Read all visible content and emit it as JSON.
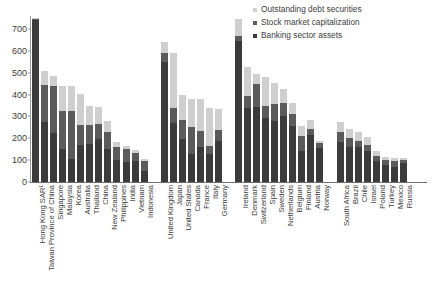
{
  "legend": {
    "position": "top-right",
    "items": [
      {
        "label": "Outstanding debt securities",
        "color": "#cfcfcf",
        "key": "debt"
      },
      {
        "label": "Stock market capitalization",
        "color": "#5b5b5b",
        "key": "stock"
      },
      {
        "label": "Banking sector assets",
        "color": "#3b3b3b",
        "key": "bank"
      }
    ]
  },
  "axis": {
    "y_ticks": [
      0,
      100,
      200,
      300,
      400,
      500,
      600,
      700
    ],
    "y_min": 0,
    "y_max": 760,
    "x_label": "",
    "y_label": ""
  },
  "caption": "",
  "chart_data": {
    "type": "bar",
    "title": "",
    "subtitle": "",
    "xlabel": "",
    "ylabel": "",
    "ylim": [
      0,
      760
    ],
    "grid": false,
    "stacked": true,
    "legend_position": "top-right",
    "series": [
      {
        "name": "Banking sector assets",
        "color": "#3b3b3b"
      },
      {
        "name": "Stock market capitalization",
        "color": "#5b5b5b"
      },
      {
        "name": "Outstanding debt securities",
        "color": "#cfcfcf"
      }
    ],
    "groups": [
      {
        "name": "Asia",
        "categories": [
          "Hong Kong SAR¹",
          "Taiwan Province of China",
          "Singapore",
          "Malaysia",
          "Korea",
          "Australia",
          "Thailand",
          "China",
          "New Zealand",
          "Philippines",
          "India",
          "Vietnam",
          "Indonesia"
        ],
        "bank": [
          740,
          275,
          225,
          150,
          105,
          170,
          175,
          195,
          150,
          100,
          90,
          95,
          50
        ],
        "stock": [
          8,
          170,
          215,
          175,
          220,
          90,
          85,
          70,
          80,
          60,
          60,
          40,
          45
        ],
        "debt": [
          2,
          65,
          45,
          115,
          115,
          145,
          90,
          80,
          50,
          25,
          15,
          10,
          10
        ],
        "total": [
          750,
          510,
          485,
          440,
          440,
          405,
          350,
          345,
          280,
          185,
          165,
          145,
          105
        ]
      },
      {
        "name": "Advanced large",
        "categories": [
          "United Kingdom",
          "Japan",
          "United States",
          "Canada",
          "France",
          "Italy",
          "Germany"
        ],
        "bank": [
          550,
          270,
          195,
          130,
          160,
          130,
          190
        ],
        "stock": [
          40,
          70,
          90,
          120,
          75,
          35,
          50
        ],
        "debt": [
          50,
          250,
          115,
          130,
          145,
          175,
          95
        ],
        "total": [
          640,
          590,
          400,
          380,
          380,
          340,
          335
        ]
      },
      {
        "name": "Advanced small",
        "categories": [
          "Ireland",
          "Denmark",
          "Switzerland",
          "Spain",
          "Sweden",
          "Netherlands",
          "Belgium",
          "Finland",
          "Austria",
          "Norway"
        ],
        "bank": [
          645,
          340,
          345,
          295,
          280,
          300,
          255,
          140,
          215,
          155
        ],
        "stock": [
          25,
          55,
          105,
          55,
          75,
          60,
          55,
          70,
          30,
          25
        ],
        "debt": [
          75,
          130,
          45,
          130,
          100,
          65,
          50,
          45,
          40,
          10
        ],
        "total": [
          745,
          525,
          495,
          480,
          455,
          425,
          360,
          255,
          285,
          190
        ]
      },
      {
        "name": "Emerging",
        "categories": [
          "South Africa",
          "Brazil",
          "Chile",
          "Israel",
          "Poland",
          "Turkey",
          "Mexico",
          "Russia"
        ],
        "bank": [
          185,
          160,
          160,
          140,
          95,
          80,
          70,
          85
        ],
        "stock": [
          45,
          40,
          30,
          30,
          25,
          20,
          25,
          15
        ],
        "debt": [
          45,
          45,
          40,
          35,
          20,
          15,
          15,
          10
        ],
        "total": [
          275,
          245,
          230,
          205,
          140,
          115,
          110,
          110
        ]
      }
    ]
  }
}
